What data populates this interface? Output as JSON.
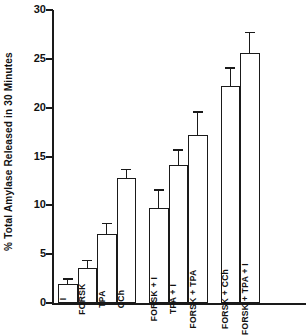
{
  "chart_data": {
    "type": "bar",
    "title": "",
    "xlabel": "",
    "ylabel": "% Total Amylase Released in 30 Minutes",
    "ylim": [
      0,
      30
    ],
    "yticks": [
      0,
      5,
      10,
      15,
      20,
      25,
      30
    ],
    "ytick_labels": [
      "0",
      "5",
      "10",
      "15",
      "20",
      "25",
      "30"
    ],
    "grid": false,
    "legend": "none",
    "error_bars": "present",
    "categories": [
      "I",
      "FORSK",
      "TPA",
      "CCh",
      "FORSK + I",
      "TPA + I",
      "FORSK + TPA",
      "FORSK + CCh",
      "FORSK + TPA + I"
    ],
    "values": [
      1.9,
      3.6,
      7.1,
      12.8,
      9.7,
      14.1,
      17.2,
      22.2,
      25.6
    ],
    "errors": [
      0.5,
      0.7,
      1.0,
      0.8,
      1.8,
      1.5,
      2.3,
      1.8,
      2.0
    ],
    "groups": [
      {
        "name": "single-agonists",
        "categories": [
          "I",
          "FORSK",
          "TPA",
          "CCh"
        ]
      },
      {
        "name": "pairwise-combinations",
        "categories": [
          "FORSK + I",
          "TPA + I",
          "FORSK + TPA"
        ]
      },
      {
        "name": "forskolin-combinations",
        "categories": [
          "FORSK + CCh",
          "FORSK + TPA + I"
        ]
      }
    ],
    "bar_fill_color": "#ffffff",
    "bar_edge_color": "#1a1a1a",
    "axis_color": "#1a1a1a"
  },
  "axis": {
    "y_title": "% Total Amylase Released in 30 Minutes"
  }
}
